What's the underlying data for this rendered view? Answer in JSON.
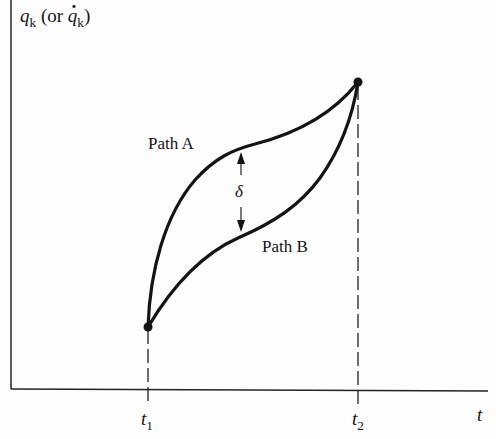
{
  "diagram": {
    "y_axis_label": {
      "main": "q",
      "sub": "k",
      "paren_open": "(or ",
      "dot_main": "q",
      "dot_sub": "k",
      "paren_close": ")"
    },
    "x_axis_label": "t",
    "ticks": [
      {
        "main": "t",
        "sub": "1"
      },
      {
        "main": "t",
        "sub": "2"
      }
    ],
    "paths": [
      {
        "label": "Path A"
      },
      {
        "label": "Path B"
      }
    ],
    "variation_symbol": "δ",
    "colors": {
      "ink": "#141414",
      "background": "#fdfdfd"
    }
  }
}
